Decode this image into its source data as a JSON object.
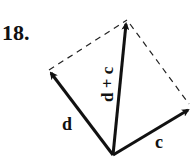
{
  "problem_number": "18.",
  "vectors": [
    {
      "label": "d",
      "from": [
        113,
        155
      ],
      "to": [
        49,
        70
      ]
    },
    {
      "label": "c",
      "from": [
        113,
        155
      ],
      "to": [
        191,
        108
      ]
    },
    {
      "label": "d + c",
      "from": [
        113,
        155
      ],
      "to": [
        127,
        20
      ]
    }
  ],
  "labels": {
    "d": "d",
    "c": "c",
    "sum": "d + c"
  }
}
